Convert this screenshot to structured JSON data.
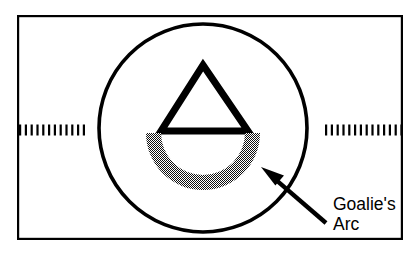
{
  "figure": {
    "kind": "sports-rink-diagram",
    "title_text": "",
    "background_color": "#ffffff",
    "ink_color": "#000000",
    "shade_color": "#6b6b6b",
    "frame": {
      "name": "figure-border",
      "x": 17,
      "y": 15,
      "width": 386,
      "height": 225,
      "stroke_width": 2.2
    },
    "center_line": {
      "name": "dashed-center-line",
      "label": "",
      "y": 130,
      "left_start_x": 19,
      "left_end_x": 86,
      "right_start_x": 325,
      "right_end_x": 401,
      "dash_length": 2.2,
      "gap_length": 3.6,
      "thickness": 11
    },
    "circle": {
      "name": "face-off-circle",
      "label": "",
      "center_x": 203,
      "center_y": 128,
      "radius": 104,
      "stroke_width": 3.6
    },
    "triangle": {
      "name": "goal-crease-triangle",
      "label": "",
      "apex_x": 203,
      "apex_y": 65,
      "base_left_x": 161,
      "base_right_x": 248,
      "base_y": 131,
      "stroke_width": 7
    },
    "arc": {
      "name": "goalies-arc-shape",
      "label": "Goalie's Arc",
      "center_x": 203,
      "center_y": 133,
      "outer_radius": 57,
      "inner_radius": 42,
      "start_angle_deg": 0,
      "end_angle_deg": 180,
      "fill_pattern": "checker-dither"
    },
    "arrow": {
      "name": "callout-arrow",
      "tip_x": 261,
      "tip_y": 167,
      "tail_x": 326,
      "tail_y": 223,
      "shaft_width": 4.4,
      "head_length": 23,
      "head_width": 17
    },
    "callout": {
      "name": "goalies-arc-callout",
      "lines": [
        "Goalie's",
        "Arc"
      ],
      "x": 333,
      "line1_baseline_y": 210,
      "line2_baseline_y": 230,
      "font_size": 17.5
    }
  }
}
